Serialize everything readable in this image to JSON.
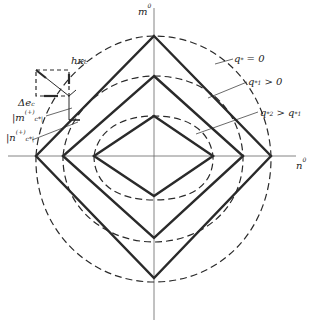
{
  "figure": {
    "axis_vertical_label": "m",
    "axis_vertical_sub": "c",
    "axis_vertical_sup": "0",
    "axis_horizontal_label": "n",
    "axis_horizontal_sub": "c",
    "axis_horizontal_sup": "0",
    "curve_labels": [
      {
        "main": "q",
        "sub": "*",
        "rest": " = 0"
      },
      {
        "main": "q",
        "sub": "*1",
        "rest": " > 0"
      },
      {
        "main": "q",
        "sub": "*2",
        "rest": " > q",
        "sub2": "*1"
      }
    ],
    "inset_labels": {
      "h_kappa": "hκ",
      "h_kappa_sub": "c",
      "delta_e": "Δe",
      "delta_e_sub": "c",
      "m_label": "|m",
      "m_sup": "(+)",
      "m_sub": "c*|",
      "n_label": "|n",
      "n_sup": "(+)",
      "n_sub": "c*|"
    },
    "colors": {
      "line": "#2a2a2a",
      "axis": "#555555",
      "background": "#ffffff"
    }
  }
}
